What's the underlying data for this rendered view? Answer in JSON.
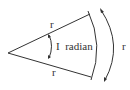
{
  "diagram": {
    "labels": {
      "upper_radius": "r",
      "lower_radius": "r",
      "arc_length": "r",
      "angle": "I  radian"
    },
    "colors": {
      "stroke": "#333333",
      "background": "#ffffff"
    },
    "icons": {
      "arc_arrow_top": "arrowhead-up-icon",
      "arc_arrow_bottom": "arrowhead-down-icon",
      "angle_arrow_top": "arrowhead-up-icon",
      "angle_arrow_bottom": "arrowhead-down-icon"
    }
  }
}
